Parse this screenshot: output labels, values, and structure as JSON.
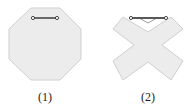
{
  "figures": [
    {
      "id": 1,
      "label": "(1)",
      "shape": "octagon",
      "fill": "#ececec",
      "stroke": "#cfcfcf"
    },
    {
      "id": 2,
      "label": "(2)",
      "shape": "x-cross",
      "fill": "#ececec",
      "stroke": "#cfcfcf"
    }
  ],
  "handle": {
    "color": "#222222"
  }
}
